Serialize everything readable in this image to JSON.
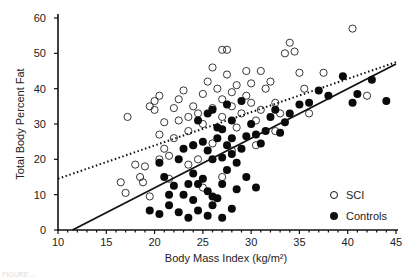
{
  "chart_data": {
    "type": "scatter",
    "title": "",
    "xlabel": "Body Mass Index (kg/m²)",
    "ylabel": "Total Body Percent Fat",
    "xlim": [
      10,
      45
    ],
    "ylim": [
      0,
      60
    ],
    "x_ticks": [
      10,
      15,
      20,
      25,
      30,
      35,
      40,
      45
    ],
    "y_ticks": [
      0,
      10,
      20,
      30,
      40,
      50,
      60
    ],
    "grid": false,
    "legend_position": "lower right",
    "series": [
      {
        "name": "SCI",
        "marker": "open-circle",
        "points": [
          [
            16.5,
            13.5
          ],
          [
            17,
            10.5
          ],
          [
            18,
            18.5
          ],
          [
            18.5,
            15
          ],
          [
            19,
            18
          ],
          [
            18.8,
            13.5
          ],
          [
            19.5,
            9.5
          ],
          [
            17.2,
            32
          ],
          [
            19.5,
            35
          ],
          [
            20,
            36.5
          ],
          [
            20.5,
            38
          ],
          [
            20,
            34
          ],
          [
            21,
            30.5
          ],
          [
            20.5,
            27
          ],
          [
            21,
            23
          ],
          [
            21.5,
            21
          ],
          [
            20.5,
            20
          ],
          [
            22,
            26
          ],
          [
            22.5,
            31
          ],
          [
            22,
            34.5
          ],
          [
            22.5,
            37
          ],
          [
            23,
            39.5
          ],
          [
            23.5,
            32
          ],
          [
            23.5,
            28
          ],
          [
            24,
            35
          ],
          [
            24.5,
            33
          ],
          [
            24,
            24
          ],
          [
            24.5,
            20
          ],
          [
            25,
            38.5
          ],
          [
            25.5,
            42
          ],
          [
            25,
            30
          ],
          [
            26,
            34.5
          ],
          [
            26,
            46
          ],
          [
            26.5,
            40
          ],
          [
            27,
            32
          ],
          [
            27,
            51
          ],
          [
            27.5,
            51
          ],
          [
            27.5,
            44
          ],
          [
            27,
            37
          ],
          [
            28,
            39
          ],
          [
            28.5,
            41
          ],
          [
            28,
            35
          ],
          [
            28.5,
            29
          ],
          [
            29,
            33
          ],
          [
            29.5,
            45
          ],
          [
            29.5,
            38
          ],
          [
            30,
            41.5
          ],
          [
            30,
            36
          ],
          [
            30.5,
            31
          ],
          [
            31,
            45
          ],
          [
            31,
            34
          ],
          [
            31.5,
            40
          ],
          [
            32,
            42
          ],
          [
            32.5,
            36
          ],
          [
            32.5,
            28
          ],
          [
            33,
            33
          ],
          [
            33.5,
            50
          ],
          [
            34,
            53
          ],
          [
            34.5,
            50.5
          ],
          [
            35,
            44.5
          ],
          [
            35.5,
            40
          ],
          [
            36,
            33
          ],
          [
            37.5,
            44.5
          ],
          [
            40.5,
            57
          ],
          [
            42,
            38
          ],
          [
            26,
            24.5
          ],
          [
            28,
            22.5
          ],
          [
            30.5,
            24
          ],
          [
            27,
            15
          ],
          [
            25,
            12
          ],
          [
            21.5,
            14.5
          ],
          [
            23.5,
            18.5
          ]
        ]
      },
      {
        "name": "Controls",
        "marker": "filled-circle",
        "points": [
          [
            19.5,
            5.5
          ],
          [
            20.5,
            4.5
          ],
          [
            21.5,
            7
          ],
          [
            22.5,
            5
          ],
          [
            23.5,
            3.5
          ],
          [
            24.5,
            5.5
          ],
          [
            25.5,
            4
          ],
          [
            26,
            7
          ],
          [
            24,
            8.5
          ],
          [
            23,
            10
          ],
          [
            22,
            12.5
          ],
          [
            21,
            15
          ],
          [
            20.5,
            19
          ],
          [
            22.5,
            20
          ],
          [
            24,
            16
          ],
          [
            24.5,
            13
          ],
          [
            25,
            14.5
          ],
          [
            25.5,
            11
          ],
          [
            26.5,
            9
          ],
          [
            27,
            13
          ],
          [
            27.5,
            17
          ],
          [
            26,
            20
          ],
          [
            25.5,
            22.5
          ],
          [
            25,
            25
          ],
          [
            26.5,
            26
          ],
          [
            27,
            28.5
          ],
          [
            27.5,
            24
          ],
          [
            28,
            21.5
          ],
          [
            28.5,
            19
          ],
          [
            29,
            23
          ],
          [
            29.5,
            26.5
          ],
          [
            30,
            30
          ],
          [
            30.5,
            27
          ],
          [
            31,
            24.5
          ],
          [
            31.5,
            28
          ],
          [
            32,
            32
          ],
          [
            32.5,
            34
          ],
          [
            33,
            27.5
          ],
          [
            33.5,
            30.5
          ],
          [
            34,
            33
          ],
          [
            35,
            35.5
          ],
          [
            36,
            36
          ],
          [
            37,
            39.5
          ],
          [
            38,
            38
          ],
          [
            39.5,
            43.5
          ],
          [
            40.5,
            36
          ],
          [
            41,
            38.5
          ],
          [
            42.5,
            42.5
          ],
          [
            44,
            36.5
          ],
          [
            26,
            34
          ],
          [
            27.5,
            35.5
          ],
          [
            28,
            31
          ],
          [
            29,
            36.5
          ],
          [
            25.5,
            33
          ],
          [
            24.5,
            31
          ],
          [
            29.5,
            15
          ],
          [
            30.5,
            12
          ],
          [
            28,
            6
          ],
          [
            27,
            3.5
          ],
          [
            26,
            9.5
          ],
          [
            23.5,
            13
          ],
          [
            21.5,
            10
          ],
          [
            28.5,
            11.5
          ],
          [
            24,
            24
          ],
          [
            23,
            23
          ],
          [
            27,
            20.5
          ],
          [
            28,
            26
          ],
          [
            26.5,
            29
          ]
        ]
      }
    ],
    "fit_lines": [
      {
        "name": "SCI regression",
        "style": "dotted",
        "x": [
          10,
          45
        ],
        "y": [
          14.5,
          47.5
        ]
      },
      {
        "name": "Controls regression",
        "style": "solid",
        "x": [
          11.5,
          45
        ],
        "y": [
          0,
          47
        ]
      }
    ]
  },
  "legend": {
    "items": [
      {
        "label": "SCI",
        "marker": "open-circle"
      },
      {
        "label": "Controls",
        "marker": "filled-circle"
      }
    ]
  },
  "caption": "FIGURE ..."
}
